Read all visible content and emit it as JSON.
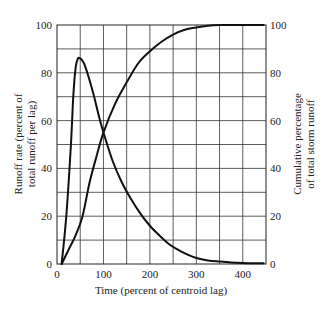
{
  "chart_data": {
    "type": "line",
    "title": "",
    "xlabel": "Time (percent of centroid lag)",
    "ylabel": "Runoff rate (percent of total runoff per lag)",
    "ylabel_right": "Cumulative percentage of total storm runoff",
    "xlim": [
      0,
      450
    ],
    "ylim": [
      0,
      100
    ],
    "ylim_right": [
      0,
      100
    ],
    "grid": true,
    "x_ticks": [
      0,
      100,
      200,
      300,
      400
    ],
    "x_tick_labels": [
      "0",
      "100",
      "200",
      "300",
      "400"
    ],
    "y_ticks": [
      0,
      20,
      40,
      60,
      80,
      100
    ],
    "y_tick_labels": [
      "0",
      "20",
      "40",
      "60",
      "80",
      "100"
    ],
    "y_right_ticks": [
      0,
      20,
      40,
      60,
      80,
      100
    ],
    "y_right_tick_labels": [
      "0",
      "20",
      "40",
      "60",
      "80",
      "100"
    ],
    "x_grid_step": 50,
    "y_grid_step": 10,
    "legend": null,
    "series": [
      {
        "name": "Runoff rate (dimensionless unit hydrograph)",
        "axis": "left",
        "x": [
          10,
          20,
          30,
          35,
          40,
          45,
          50,
          55,
          60,
          70,
          80,
          90,
          100,
          120,
          140,
          160,
          180,
          200,
          220,
          240,
          260,
          280,
          300,
          325,
          350,
          375,
          400,
          425,
          445
        ],
        "y": [
          0,
          20,
          50,
          70,
          82,
          86,
          86,
          85,
          83,
          77,
          70,
          62,
          55,
          43,
          34,
          27,
          21,
          16,
          12,
          8.5,
          6,
          4,
          2.5,
          1.5,
          1,
          0.6,
          0.4,
          0.3,
          0.3
        ]
      },
      {
        "name": "Cumulative percentage of total storm runoff (S-curve)",
        "axis": "right",
        "x": [
          10,
          25,
          40,
          55,
          70,
          85,
          100,
          125,
          150,
          175,
          200,
          225,
          250,
          275,
          300,
          325,
          350,
          375,
          400,
          445
        ],
        "y": [
          0,
          6,
          12,
          20,
          34,
          45,
          55,
          67,
          76,
          84,
          89,
          93,
          96,
          98,
          99,
          99.7,
          100,
          100,
          100,
          100
        ]
      }
    ]
  },
  "labels": {
    "xlabel": "Time (percent of centroid lag)",
    "ylabel_line1": "Runoff rate (percent of",
    "ylabel_line2": "total runoff per lag)",
    "ylabel_right_line1": "Cumulative percentage",
    "ylabel_right_line2": "of total storm runoff"
  }
}
